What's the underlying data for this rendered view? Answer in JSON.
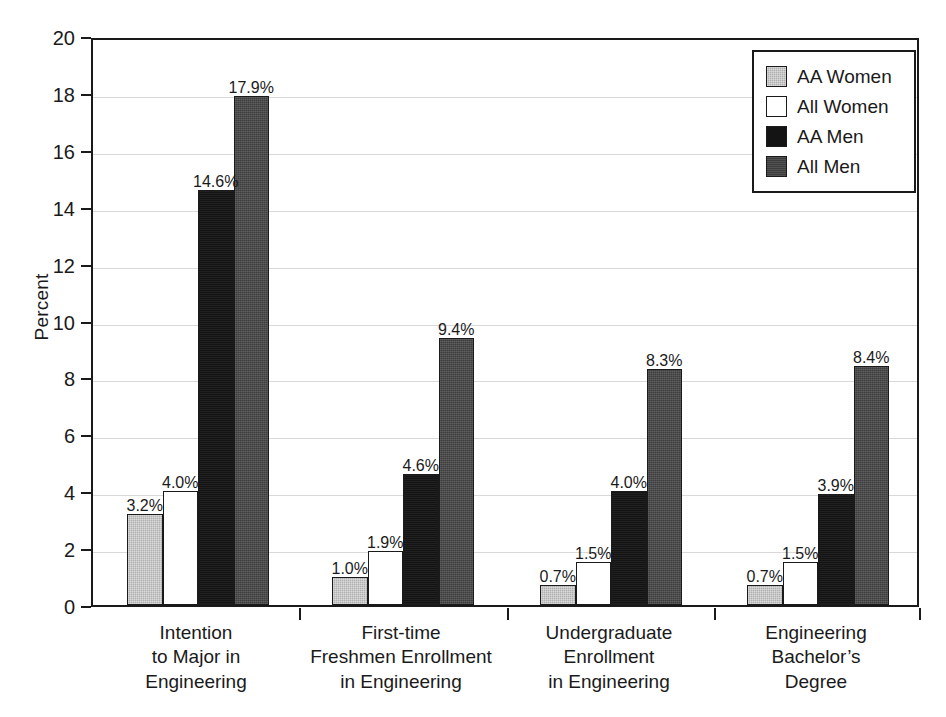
{
  "chart_data": {
    "type": "bar",
    "title": "",
    "subtitle": "",
    "xlabel": "",
    "ylabel": "Percent",
    "ylim": [
      0,
      20
    ],
    "ytick_step": 2,
    "yticks": [
      "20",
      "18",
      "16",
      "14",
      "12",
      "10",
      "8",
      "6",
      "4",
      "2",
      "0"
    ],
    "grid": true,
    "grid_axis": "y",
    "legend_position": "top-right",
    "categories": [
      "Intention\nto Major in\nEngineering",
      "First-time\nFreshmen Enrollment\nin Engineering",
      "Undergraduate\nEnrollment\nin Engineering",
      "Engineering\nBachelor’s\nDegree"
    ],
    "series": [
      {
        "name": "AA Women",
        "color": "#b0b0b0",
        "values": [
          3.2,
          1.0,
          0.7,
          0.7
        ],
        "labels": [
          "3.2%",
          "1.0%",
          "0.7%",
          "0.7%"
        ]
      },
      {
        "name": "All Women",
        "color": "#ffffff",
        "values": [
          4.0,
          1.9,
          1.5,
          1.5
        ],
        "labels": [
          "4.0%",
          "1.9%",
          "1.5%",
          "1.5%"
        ]
      },
      {
        "name": "AA Men",
        "color": "#141414",
        "values": [
          14.6,
          4.6,
          4.0,
          3.9
        ],
        "labels": [
          "14.6%",
          "4.6%",
          "4.0%",
          "3.9%"
        ]
      },
      {
        "name": "All Men",
        "color": "#3d3d3d",
        "values": [
          17.9,
          9.4,
          8.3,
          8.4
        ],
        "labels": [
          "17.9%",
          "9.4%",
          "8.3%",
          "8.4%"
        ]
      }
    ]
  },
  "legend": {
    "entries": [
      {
        "label": "AA Women",
        "swatch": "light-gray"
      },
      {
        "label": "All Women",
        "swatch": "white"
      },
      {
        "label": "AA Men",
        "swatch": "black"
      },
      {
        "label": "All Men",
        "swatch": "dark-gray"
      }
    ]
  },
  "axes": {
    "y_title": "Percent"
  }
}
